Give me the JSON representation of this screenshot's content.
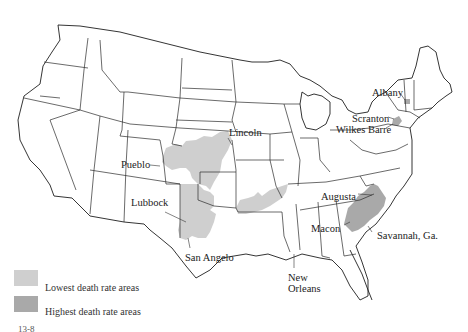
{
  "map": {
    "title": "United States death rate areas",
    "city_labels": [
      {
        "name": "Lincoln",
        "x": 229,
        "y": 127
      },
      {
        "name": "Pueblo",
        "x": 121,
        "y": 159
      },
      {
        "name": "Lubbock",
        "x": 131,
        "y": 197
      },
      {
        "name": "San Angelo",
        "x": 185,
        "y": 252
      },
      {
        "name": "New Orleans",
        "x": 288,
        "y": 272
      },
      {
        "name": "Albany",
        "x": 372,
        "y": 87
      },
      {
        "name": "Scranton",
        "x": 352,
        "y": 113
      },
      {
        "name": "Wilkes Barre",
        "x": 336,
        "y": 124
      },
      {
        "name": "Augusta",
        "x": 321,
        "y": 191
      },
      {
        "name": "Macon",
        "x": 311,
        "y": 223
      },
      {
        "name": "Savannah, Ga.",
        "x": 377,
        "y": 230
      }
    ],
    "colors": {
      "lowest": "#cfcfcf",
      "highest": "#a9a9a9",
      "outline": "#2b2b2b"
    }
  },
  "legend": {
    "items": [
      {
        "label": "Lowest death rate areas",
        "color": "#cfcfcf"
      },
      {
        "label": "Highest death rate areas",
        "color": "#a9a9a9"
      }
    ]
  },
  "caption_fragment": "13-8"
}
